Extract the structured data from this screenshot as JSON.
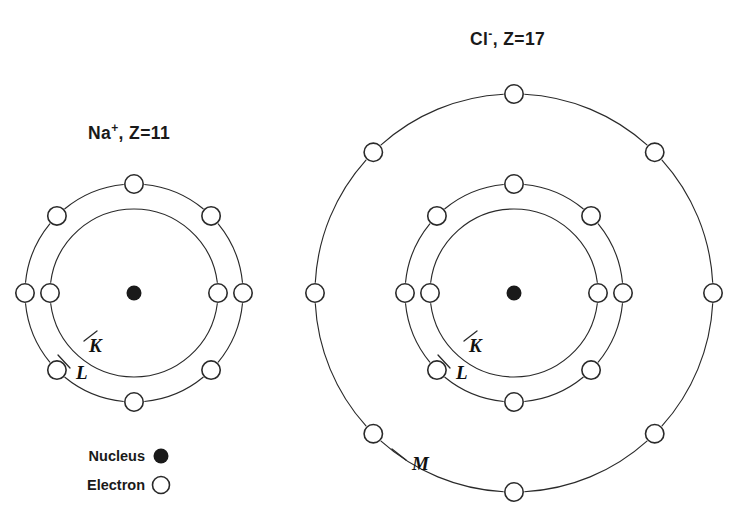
{
  "canvas": {
    "width": 753,
    "height": 527,
    "background": "#ffffff"
  },
  "style": {
    "stroke": "#2a2a2a",
    "nucleus_fill": "#1a1a1a",
    "electron_fill": "#ffffff",
    "text": "#1a1a1a"
  },
  "diagram": {
    "kind": "bohr-shell-model",
    "caption_ions": [
      "Na+",
      "Cl-"
    ]
  },
  "ions": [
    {
      "id": "sodium",
      "name": "Na",
      "charge": "+",
      "z_label": ", Z=11",
      "title_plain": "Na+, Z=11",
      "atomic_number": 11,
      "title_x": 88,
      "title_y": 139,
      "center": {
        "x": 134,
        "y": 293
      },
      "nucleus_radius": 7.5,
      "electron_radius": 9.2,
      "shells": [
        {
          "label": "K",
          "radius": 84,
          "electron_count": 2,
          "angles": [
            0,
            180
          ],
          "label_x": 89,
          "label_y": 352,
          "leader": [
            [
              84,
              341
            ],
            [
              97,
              331
            ]
          ]
        },
        {
          "label": "L",
          "radius": 109,
          "electron_count": 8,
          "angles": [
            0,
            45,
            90,
            135,
            180,
            225,
            270,
            315
          ],
          "label_x": 76,
          "label_y": 379,
          "leader": [
            [
              70,
              368
            ],
            [
              58,
              355
            ]
          ]
        }
      ]
    },
    {
      "id": "chloride",
      "name": "Cl",
      "charge": "-",
      "z_label": ", Z=17",
      "title_plain": "Cl-, Z=17",
      "atomic_number": 17,
      "title_x": 470,
      "title_y": 45,
      "center": {
        "x": 514,
        "y": 293
      },
      "nucleus_radius": 7.5,
      "electron_radius": 9.2,
      "shells": [
        {
          "label": "K",
          "radius": 84,
          "electron_count": 2,
          "angles": [
            0,
            180
          ],
          "label_x": 469,
          "label_y": 352,
          "leader": [
            [
              464,
              341
            ],
            [
              477,
              331
            ]
          ]
        },
        {
          "label": "L",
          "radius": 109,
          "electron_count": 8,
          "angles": [
            0,
            45,
            90,
            135,
            180,
            225,
            270,
            315
          ],
          "label_x": 456,
          "label_y": 379,
          "leader": [
            [
              450,
              368
            ],
            [
              438,
              355
            ]
          ]
        },
        {
          "label": "M",
          "radius": 199,
          "electron_count": 8,
          "angles": [
            0,
            45,
            90,
            135,
            180,
            225,
            270,
            315
          ],
          "label_x": 412,
          "label_y": 470,
          "leader": [
            [
              406,
              460
            ],
            [
              392,
              449
            ]
          ]
        }
      ]
    }
  ],
  "legend": {
    "items": [
      {
        "label": "Nucleus",
        "marker": "filled-circle",
        "text_x": 145,
        "text_y": 461,
        "marker_x": 161,
        "marker_y": 456,
        "marker_r": 7.5
      },
      {
        "label": "Electron",
        "marker": "open-circle",
        "text_x": 145,
        "text_y": 490,
        "marker_x": 161,
        "marker_y": 485,
        "marker_r": 8.5
      }
    ]
  }
}
